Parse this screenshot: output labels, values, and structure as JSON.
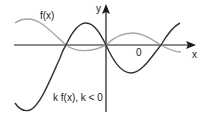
{
  "diagram": {
    "labels": {
      "y_axis": "y",
      "x_axis": "x",
      "origin": "0",
      "curve_f": "f(x)",
      "curve_kf": "k f(x), k < 0"
    },
    "colors": {
      "axis": "#1a1a1a",
      "f_curve": "#a6a6a6",
      "kf_curve": "#333333"
    },
    "curves": [
      {
        "name": "f(x)",
        "color": "#a6a6a6",
        "description": "wave of small amplitude, positive at left, crosses x-axis at three points"
      },
      {
        "name": "k f(x), k < 0",
        "color": "#333333",
        "description": "reflected and vertically stretched version of f(x), same x-intercepts"
      }
    ]
  }
}
